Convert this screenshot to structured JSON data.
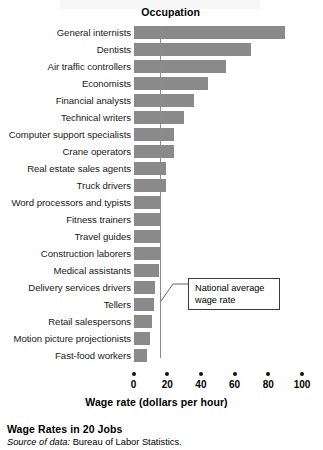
{
  "header": {
    "column_header": "Occupation"
  },
  "callout": {
    "line1": "National average",
    "line2": "wage rate",
    "value": 16
  },
  "figure": {
    "title": "Wage Rates in 20 Jobs",
    "source_label": "Source of data:",
    "source_value": "Bureau of Labor Statistics."
  },
  "colors": {
    "bar": "#8a8a8a",
    "axis": "#111111",
    "average_line": "#8c8c8c",
    "callout_border": "#3a3a3a"
  },
  "chart_data": {
    "type": "bar",
    "orientation": "horizontal",
    "title": "Wage Rates in 20 Jobs",
    "xlabel": "Wage rate (dollars per hour)",
    "ylabel": "Occupation",
    "xlim": [
      0,
      100
    ],
    "xticks": [
      0,
      20,
      40,
      60,
      80,
      100
    ],
    "xtick_labels": [
      "0",
      "20",
      "40",
      "60",
      "80",
      "100"
    ],
    "grid": false,
    "legend": false,
    "annotations": [
      {
        "text": "National average wage rate",
        "type": "reference-line",
        "axis": "x",
        "value": 16
      }
    ],
    "categories": [
      "General internists",
      "Dentists",
      "Air traffic controllers",
      "Economists",
      "Financial analysts",
      "Technical writers",
      "Computer support specialists",
      "Crane operators",
      "Real estate sales agents",
      "Truck drivers",
      "Word processors and typists",
      "Fitness trainers",
      "Travel guides",
      "Construction laborers",
      "Medical assistants",
      "Delivery services drivers",
      "Tellers",
      "Retail salespersons",
      "Motion picture projectionists",
      "Fast-food workers"
    ],
    "values": [
      90,
      70,
      55,
      44,
      36,
      30,
      24,
      24,
      19,
      19,
      16,
      16,
      16,
      16,
      15,
      13,
      12,
      11,
      10,
      8
    ]
  }
}
